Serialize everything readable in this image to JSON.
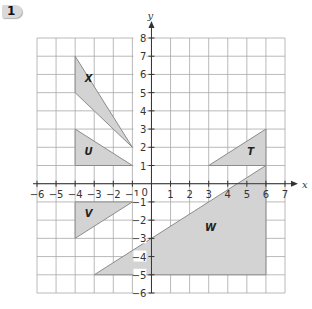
{
  "question": {
    "number": "1"
  },
  "axes": {
    "x_label": "x",
    "y_label": "y",
    "x_min": -6,
    "x_max": 7,
    "y_min": -6,
    "y_max": 8,
    "x_ticks": [
      "-6",
      "-5",
      "-4",
      "-3",
      "-2",
      "-1",
      "1",
      "2",
      "3",
      "4",
      "5",
      "6",
      "7"
    ],
    "y_ticks": [
      "8",
      "7",
      "6",
      "5",
      "4",
      "3",
      "2",
      "1",
      "-1",
      "-2",
      "-3",
      "-4",
      "-5",
      "-6"
    ],
    "origin_label": "0"
  },
  "colors": {
    "grid": "#a8a8a8",
    "axis": "#333333",
    "fill": "#d3d3d3",
    "stroke": "#8c8c8c"
  },
  "shapes": [
    {
      "label": "X",
      "vertices": [
        [
          -4,
          7
        ],
        [
          -4,
          5
        ],
        [
          -1,
          2
        ]
      ],
      "label_pos": [
        -3.3,
        5.6
      ]
    },
    {
      "label": "U",
      "vertices": [
        [
          -4,
          3
        ],
        [
          -4,
          1
        ],
        [
          -1,
          1
        ]
      ],
      "label_pos": [
        -3.3,
        1.6
      ]
    },
    {
      "label": "V",
      "vertices": [
        [
          -4,
          -1
        ],
        [
          -1,
          -1
        ],
        [
          -4,
          -3
        ]
      ],
      "label_pos": [
        -3.3,
        -1.8
      ]
    },
    {
      "label": "T",
      "vertices": [
        [
          3,
          1
        ],
        [
          6,
          1
        ],
        [
          6,
          3
        ]
      ],
      "label_pos": [
        5.2,
        1.6
      ]
    },
    {
      "label": "W",
      "vertices": [
        [
          -3,
          -5
        ],
        [
          6,
          -5
        ],
        [
          6,
          1
        ]
      ],
      "label_pos": [
        3.1,
        -2.6
      ]
    }
  ]
}
